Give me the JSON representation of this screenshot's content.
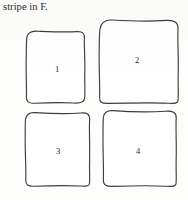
{
  "figure": {
    "caption_fragment": "stripe in F.",
    "panel_count": 4,
    "background_color": "#fdfdfc",
    "ink_color": "#3d3d3d",
    "text_color": "#1f1f1f",
    "panels": [
      {
        "label": "1",
        "shape": "hand-drawn-rounded-square",
        "row": 1,
        "column": 1
      },
      {
        "label": "2",
        "shape": "hand-drawn-rounded-square",
        "row": 1,
        "column": 2
      },
      {
        "label": "3",
        "shape": "hand-drawn-rounded-square",
        "row": 2,
        "column": 1
      },
      {
        "label": "4",
        "shape": "hand-drawn-rounded-square",
        "row": 2,
        "column": 2
      }
    ]
  }
}
